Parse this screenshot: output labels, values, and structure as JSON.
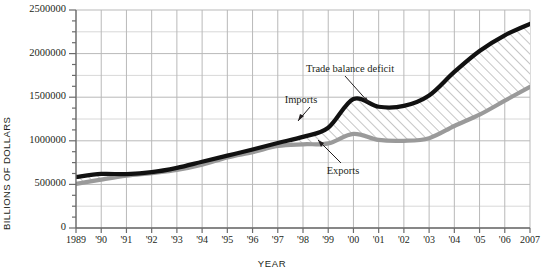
{
  "chart_data": {
    "type": "area",
    "title": "",
    "xlabel": "YEAR",
    "ylabel": "BILLIONS OF DOLLARS",
    "x": [
      1989,
      1990,
      1991,
      1992,
      1993,
      1994,
      1995,
      1996,
      1997,
      1998,
      1999,
      2000,
      2001,
      2002,
      2003,
      2004,
      2005,
      2006,
      2007
    ],
    "xtick_labels": [
      "1989",
      "'90",
      "'91",
      "'92",
      "'93",
      "'94",
      "'95",
      "'96",
      "'97",
      "'98",
      "'99",
      "'00",
      "'01",
      "'02",
      "'03",
      "'04",
      "'05",
      "'06",
      "2007"
    ],
    "ytick_labels": [
      "0",
      "500000",
      "1000000",
      "1500000",
      "2000000",
      "2500000"
    ],
    "ytick_values": [
      0,
      500000,
      1000000,
      1500000,
      2000000,
      2500000
    ],
    "ylim": [
      0,
      2500000
    ],
    "xlim": [
      1989,
      2007
    ],
    "grid": true,
    "grid_minor_y": 250000,
    "legend": "annotations",
    "series": [
      {
        "name": "Imports",
        "color": "#111111",
        "values": [
          585000,
          620000,
          618000,
          640000,
          690000,
          760000,
          830000,
          900000,
          975000,
          1045000,
          1150000,
          1480000,
          1390000,
          1400000,
          1520000,
          1790000,
          2030000,
          2210000,
          2340000
        ]
      },
      {
        "name": "Exports",
        "color": "#9a9a9a",
        "values": [
          505000,
          555000,
          600000,
          630000,
          665000,
          725000,
          810000,
          870000,
          940000,
          960000,
          970000,
          1080000,
          1010000,
          1000000,
          1030000,
          1170000,
          1300000,
          1460000,
          1620000
        ]
      }
    ],
    "fill": {
      "name": "Trade balance deficit",
      "between": [
        "Imports",
        "Exports"
      ],
      "pattern": "diagonal-hatch",
      "hatch_color": "#8d8d8d"
    },
    "annotations": [
      {
        "text": "Trade balance deficit",
        "x": 350,
        "y": 68
      },
      {
        "text": "Imports",
        "x": 301,
        "y": 99
      },
      {
        "text": "Exports",
        "x": 343,
        "y": 170
      }
    ]
  }
}
